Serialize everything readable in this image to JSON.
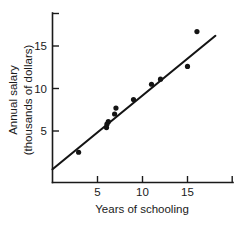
{
  "figure": {
    "background_color": "#ffffff",
    "ink_color": "#141414",
    "width": 239,
    "height": 226
  },
  "chart_data": {
    "type": "scatter",
    "title": "",
    "subtitle": "",
    "xlabel": "Years of schooling",
    "ylabel_line1": "Annual salary",
    "ylabel_line2": "(thousands of dollars)",
    "ylabel": "Annual salary (thousands of dollars)",
    "xlim": [
      0,
      20
    ],
    "ylim": [
      0,
      20
    ],
    "xticks": [
      5,
      10,
      15
    ],
    "xtick_labels": [
      "5",
      "10",
      "15"
    ],
    "yticks": [
      5,
      10,
      15
    ],
    "ytick_labels": [
      "5",
      "10",
      "15"
    ],
    "grid": false,
    "legend": false,
    "legend_position": "none",
    "marker_color": "#141414",
    "marker_radius": 2.6,
    "points": [
      {
        "x": 2.9,
        "y": 2.5
      },
      {
        "x": 6.0,
        "y": 5.4
      },
      {
        "x": 6.05,
        "y": 5.8
      },
      {
        "x": 6.2,
        "y": 6.1
      },
      {
        "x": 6.9,
        "y": 7.0
      },
      {
        "x": 7.05,
        "y": 7.7
      },
      {
        "x": 9.0,
        "y": 8.7
      },
      {
        "x": 11.0,
        "y": 10.5
      },
      {
        "x": 12.0,
        "y": 11.1
      },
      {
        "x": 15.0,
        "y": 12.6
      },
      {
        "x": 16.05,
        "y": 16.7
      }
    ],
    "series": [
      {
        "name": "observations",
        "x": [
          2.9,
          6.0,
          6.05,
          6.2,
          6.9,
          7.05,
          9.0,
          11.0,
          12.0,
          15.0,
          16.05
        ],
        "values": [
          2.5,
          5.4,
          5.8,
          6.1,
          7.0,
          7.7,
          8.7,
          10.5,
          11.1,
          12.6,
          16.7
        ]
      }
    ],
    "fit_line": {
      "name": "regression-line",
      "color": "#141414",
      "x_start": 0.0,
      "y_start": 0.5,
      "x_end": 18.1,
      "y_end": 16.2
    },
    "annotations": []
  }
}
